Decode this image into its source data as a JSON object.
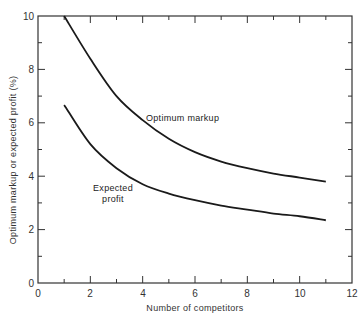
{
  "chart_data": {
    "type": "line",
    "title": "",
    "xlabel": "Number of competitors",
    "ylabel": "Optimum markup or expected profit (%)",
    "xlim": [
      0,
      12
    ],
    "ylim": [
      0,
      10
    ],
    "x_ticks": [
      "0",
      "2",
      "4",
      "6",
      "8",
      "10",
      "12"
    ],
    "y_ticks": [
      "0",
      "2",
      "4",
      "6",
      "8",
      "10"
    ],
    "grid": false,
    "legend": "none (curves labeled inline)",
    "series": [
      {
        "name": "Optimum markup",
        "x": [
          1,
          2,
          3,
          4,
          5,
          6,
          7,
          8,
          9,
          10,
          11
        ],
        "y": [
          10.0,
          8.4,
          7.0,
          6.1,
          5.4,
          4.9,
          4.55,
          4.3,
          4.1,
          3.95,
          3.8
        ]
      },
      {
        "name": "Expected profit",
        "x": [
          1,
          2,
          3,
          4,
          5,
          6,
          7,
          8,
          9,
          10,
          11
        ],
        "y": [
          6.67,
          5.2,
          4.3,
          3.7,
          3.35,
          3.1,
          2.9,
          2.75,
          2.6,
          2.5,
          2.35
        ]
      }
    ],
    "annotations": [
      {
        "text": "Optimum markup",
        "x": 5.7,
        "y": 6.1
      },
      {
        "text": "Expected\nprofit",
        "x": 2.9,
        "y": 3.5
      }
    ]
  },
  "labels": {
    "xlabel": "Number of competitors",
    "ylabel": "Optimum markup or expected profit (%)",
    "annot_markup": "Optimum markup",
    "annot_profit_line1": "Expected",
    "annot_profit_line2": "profit"
  },
  "ticks": {
    "x": [
      "0",
      "2",
      "4",
      "6",
      "8",
      "10",
      "12"
    ],
    "y": [
      "0",
      "2",
      "4",
      "6",
      "8",
      "10"
    ]
  }
}
